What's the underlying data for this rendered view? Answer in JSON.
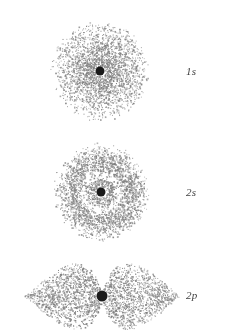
{
  "figure": {
    "background_color": "#ffffff",
    "width": 226,
    "height": 335
  },
  "style": {
    "dot_color": "#7d7d7d",
    "dot_color_light": "#9a9a9a",
    "nucleus_color": "#1a1a1a",
    "label_color": "#3f3f3f"
  },
  "orbitals": [
    {
      "id": "1s",
      "label": "1s",
      "principal": "1",
      "subshell": "s",
      "type": "s",
      "nodes": 0,
      "center": {
        "x": 100,
        "y": 71
      },
      "radius": 50,
      "nucleus_radius": 4.5,
      "dot_count": 2600
    },
    {
      "id": "2s",
      "label": "2s",
      "principal": "2",
      "subshell": "s",
      "type": "s",
      "nodes": 1,
      "center": {
        "x": 101,
        "y": 192
      },
      "radius": 50,
      "nucleus_radius": 4.5,
      "dot_count": 2900
    },
    {
      "id": "2p",
      "label": "2p",
      "principal": "2",
      "subshell": "p",
      "type": "p",
      "nodes": 1,
      "center": {
        "x": 102,
        "y": 296
      },
      "lobe_length": 78,
      "lobe_width": 28,
      "nucleus_radius": 5.5,
      "dot_count": 2600
    }
  ]
}
